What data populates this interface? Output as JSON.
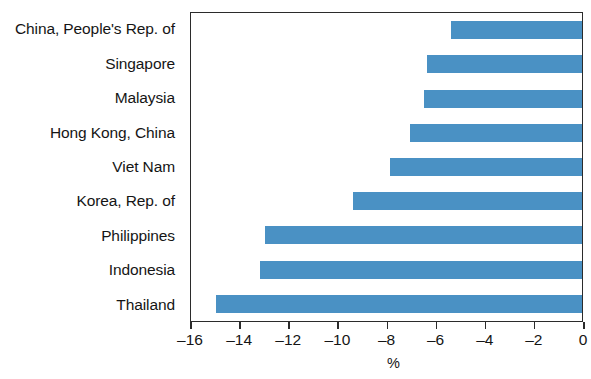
{
  "chart_data": {
    "type": "bar",
    "orientation": "horizontal",
    "title": "",
    "subtitle": "",
    "xlabel": "%",
    "ylabel": "",
    "categories": [
      "China, People's Rep. of",
      "Singapore",
      "Malaysia",
      "Hong Kong, China",
      "Viet Nam",
      "Korea, Rep. of",
      "Philippines",
      "Indonesia",
      "Thailand"
    ],
    "values": [
      -5.4,
      -6.4,
      -6.5,
      -7.1,
      -7.9,
      -9.4,
      -13.0,
      -13.2,
      -15.0
    ],
    "series": [
      {
        "name": "Change",
        "values": [
          -5.4,
          -6.4,
          -6.5,
          -7.1,
          -7.9,
          -9.4,
          -13.0,
          -13.2,
          -15.0
        ]
      }
    ],
    "xlim": [
      -16,
      0
    ],
    "xticks": [
      -16,
      -14,
      -12,
      -10,
      -8,
      -6,
      -4,
      -2,
      0
    ],
    "xtick_labels": [
      "–16",
      "–14",
      "–12",
      "–10",
      "–8",
      "–6",
      "–4",
      "–2",
      "0"
    ],
    "grid": false,
    "legend": false,
    "legend_position": "none",
    "bar_color": "#4a91c4",
    "axis_color": "#2b2b2b",
    "background_color": "#ffffff"
  }
}
